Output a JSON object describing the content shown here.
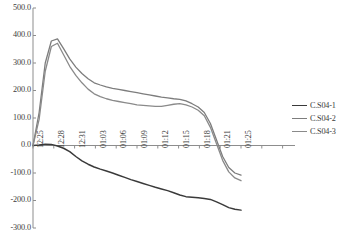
{
  "chart_data": {
    "type": "line",
    "title": "",
    "xlabel": "",
    "ylabel": "",
    "ylim": [
      -300,
      500
    ],
    "grid": false,
    "legend_position": "right",
    "ytick_labels": [
      "500.0",
      "400.0",
      "300.0",
      "200.0",
      "100.0",
      "0.0",
      "-100.0",
      "-200.0",
      "-300.0"
    ],
    "ytick_values": [
      500,
      400,
      300,
      200,
      100,
      0,
      -100,
      -200,
      -300
    ],
    "xtick_labels": [
      "12:25",
      "12:28",
      "12:31",
      "01:03",
      "01:06",
      "01:09",
      "01:12",
      "01:15",
      "01:18",
      "01:21",
      "01:25"
    ],
    "x": [
      "12:25",
      "12:26",
      "12:27",
      "12:28",
      "12:29",
      "12:30",
      "12:31",
      "12:32",
      "01:01",
      "01:02",
      "01:03",
      "01:04",
      "01:05",
      "01:06",
      "01:07",
      "01:08",
      "01:09",
      "01:10",
      "01:11",
      "01:12",
      "01:13",
      "01:14",
      "01:15",
      "01:16",
      "01:17",
      "01:18",
      "01:19",
      "01:20",
      "01:21",
      "01:22",
      "01:23",
      "01:24",
      "01:25",
      "01:26",
      "01:27"
    ],
    "series": [
      {
        "name": "C.S04-1",
        "color": "#3a3a3a",
        "values": [
          0,
          2,
          5,
          4,
          -2,
          -10,
          -22,
          -40,
          -56,
          -68,
          -78,
          -86,
          -93,
          -100,
          -108,
          -116,
          -124,
          -131,
          -138,
          -145,
          -152,
          -158,
          -164,
          -172,
          -180,
          -186,
          -188,
          -190,
          -193,
          -196,
          -205,
          -215,
          -226,
          -232,
          -235
        ]
      },
      {
        "name": "C.S04-2",
        "color": "#7d7d7d",
        "values": [
          0,
          120,
          300,
          380,
          388,
          352,
          315,
          285,
          262,
          243,
          228,
          220,
          213,
          208,
          204,
          200,
          196,
          192,
          188,
          184,
          180,
          176,
          173,
          170,
          168,
          162,
          152,
          140,
          120,
          80,
          20,
          -40,
          -80,
          -100,
          -108
        ]
      },
      {
        "name": "C.S04-3",
        "color": "#8a8a8a",
        "values": [
          0,
          95,
          270,
          360,
          372,
          330,
          288,
          255,
          228,
          205,
          188,
          178,
          170,
          164,
          160,
          156,
          152,
          148,
          146,
          144,
          142,
          142,
          146,
          150,
          152,
          148,
          140,
          128,
          108,
          66,
          6,
          -54,
          -96,
          -118,
          -128
        ]
      }
    ]
  },
  "legend": {
    "items": [
      {
        "label": "C.S04-1"
      },
      {
        "label": "C.S04-2"
      },
      {
        "label": "C.S04-3"
      }
    ]
  }
}
